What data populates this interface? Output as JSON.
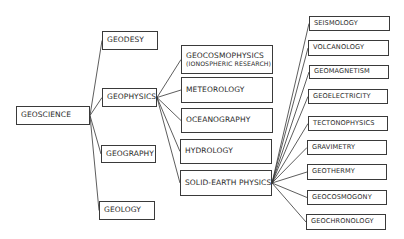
{
  "diagram": {
    "root": {
      "id": "geoscience",
      "label": "GEOSCIENCE",
      "box": [
        16,
        106,
        74,
        19
      ]
    },
    "level1": [
      {
        "id": "geodesy",
        "label": "GEODESY",
        "box": [
          102,
          31,
          56,
          19
        ]
      },
      {
        "id": "geophysics",
        "label": "GEOPHYSICS",
        "box": [
          102,
          88,
          55,
          19
        ]
      },
      {
        "id": "geography",
        "label": "GEOGRAPHY",
        "box": [
          101,
          145,
          55,
          18
        ]
      },
      {
        "id": "geology",
        "label": "GEOLOGY",
        "box": [
          99,
          201,
          56,
          19
        ]
      }
    ],
    "level2": [
      {
        "id": "geocosmophysics",
        "label": "GEOCOSMOPHYSICS",
        "label2": "(IONOSPHERIC RESEARCH)",
        "box": [
          181,
          45,
          92,
          29
        ]
      },
      {
        "id": "meteorology",
        "label": "METEOROLOGY",
        "box": [
          181,
          77,
          92,
          26
        ]
      },
      {
        "id": "oceanography",
        "label": "OCEANOGRAPHY",
        "box": [
          181,
          108,
          92,
          25
        ]
      },
      {
        "id": "hydrology",
        "label": "HYDROLOGY",
        "box": [
          180,
          139,
          92,
          25
        ]
      },
      {
        "id": "solid-earth-physics",
        "label": "SOLID-EARTH PHYSICS",
        "box": [
          180,
          170,
          92,
          26
        ]
      }
    ],
    "level3": [
      {
        "id": "seismology",
        "label": "SEISMOLOGY",
        "box": [
          309,
          16,
          81,
          15
        ]
      },
      {
        "id": "volcanology",
        "label": "VOLCANOLOGY",
        "box": [
          308,
          40,
          81,
          16
        ]
      },
      {
        "id": "geomagnetism",
        "label": "GEOMAGNETISM",
        "box": [
          309,
          65,
          80,
          14
        ]
      },
      {
        "id": "geoelectricity",
        "label": "GEOELECTRICITY",
        "box": [
          308,
          89,
          80,
          15
        ]
      },
      {
        "id": "tectonophysics",
        "label": "TECTONOPHYSICS",
        "box": [
          308,
          116,
          80,
          15
        ]
      },
      {
        "id": "gravimetry",
        "label": "GRAVIMETRY",
        "box": [
          307,
          140,
          80,
          15
        ]
      },
      {
        "id": "geothermy",
        "label": "GEOTHERMY",
        "box": [
          307,
          164,
          80,
          16
        ]
      },
      {
        "id": "geocosmogony",
        "label": "GEOCOSMOGONY",
        "box": [
          307,
          190,
          80,
          15
        ]
      },
      {
        "id": "geochronology",
        "label": "GEOCHRONOLOGY",
        "box": [
          306,
          214,
          80,
          16
        ]
      }
    ],
    "edges": [
      [
        "geoscience",
        "geodesy"
      ],
      [
        "geoscience",
        "geophysics"
      ],
      [
        "geoscience",
        "geography"
      ],
      [
        "geoscience",
        "geology"
      ],
      [
        "geophysics",
        "geocosmophysics"
      ],
      [
        "geophysics",
        "meteorology"
      ],
      [
        "geophysics",
        "oceanography"
      ],
      [
        "geophysics",
        "hydrology"
      ],
      [
        "geophysics",
        "solid-earth-physics"
      ],
      [
        "solid-earth-physics",
        "seismology"
      ],
      [
        "solid-earth-physics",
        "volcanology"
      ],
      [
        "solid-earth-physics",
        "geomagnetism"
      ],
      [
        "solid-earth-physics",
        "geoelectricity"
      ],
      [
        "solid-earth-physics",
        "tectonophysics"
      ],
      [
        "solid-earth-physics",
        "gravimetry"
      ],
      [
        "solid-earth-physics",
        "geothermy"
      ],
      [
        "solid-earth-physics",
        "geocosmogony"
      ],
      [
        "solid-earth-physics",
        "geochronology"
      ]
    ],
    "colors": {
      "line": "#333333",
      "border": "#3a3a3a",
      "text": "#2a2a2a",
      "background": "#ffffff"
    }
  }
}
